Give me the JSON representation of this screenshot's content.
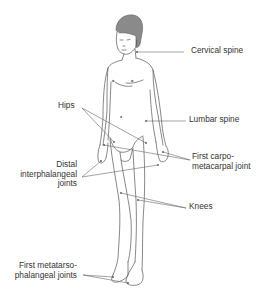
{
  "diagram": {
    "labels": {
      "cervical_spine": "Cervical spine",
      "lumbar_spine": "Lumbar spine",
      "hips": "Hips",
      "distal_ip_line1": "Distal",
      "distal_ip_line2": "interphalangeal",
      "distal_ip_line3": "joints",
      "first_cmc_line1": "First carpo-",
      "first_cmc_line2": "metacarpal joint",
      "knees": "Knees",
      "first_mtp_line1": "First metatarso-",
      "first_mtp_line2": "phalangeal joints"
    },
    "colors": {
      "outline": "#555555",
      "hair": "#8a8a8a",
      "leader_line": "#666666",
      "text": "#333333"
    }
  }
}
